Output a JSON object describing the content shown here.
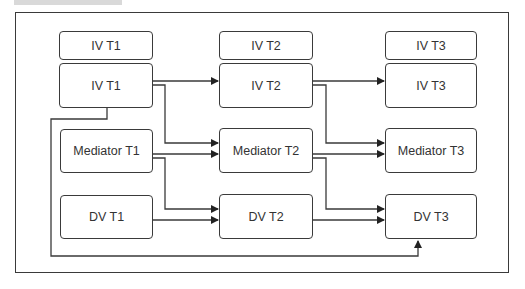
{
  "diagram": {
    "type": "cross-lagged panel",
    "header_labels": [
      {
        "id": "hdr-t1",
        "label": "IV T1"
      },
      {
        "id": "hdr-t2",
        "label": "IV T2"
      },
      {
        "id": "hdr-t3",
        "label": "IV T3"
      }
    ],
    "nodes": {
      "iv_t1": "IV T1",
      "iv_t2": "IV T2",
      "iv_t3": "IV T3",
      "med_t1": "Mediator T1",
      "med_t2": "Mediator T2",
      "med_t3": "Mediator T3",
      "dv_t1": "DV T1",
      "dv_t2": "DV T2",
      "dv_t3": "DV T3"
    },
    "edges": [
      [
        "IV T1",
        "IV T2"
      ],
      [
        "IV T1",
        "Mediator T2"
      ],
      [
        "Mediator T1",
        "Mediator T2"
      ],
      [
        "Mediator T1",
        "DV T2"
      ],
      [
        "DV T1",
        "DV T2"
      ],
      [
        "IV T2",
        "IV T3"
      ],
      [
        "IV T2",
        "Mediator T3"
      ],
      [
        "Mediator T2",
        "Mediator T3"
      ],
      [
        "Mediator T2",
        "DV T3"
      ],
      [
        "DV T2",
        "DV T3"
      ],
      [
        "IV T1",
        "DV T3"
      ]
    ],
    "colors": {
      "stroke": "#3a3a3a",
      "text": "#333333",
      "background": "#ffffff"
    }
  }
}
